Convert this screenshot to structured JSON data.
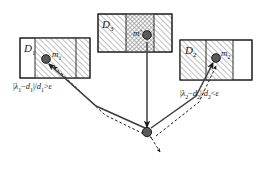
{
  "figure": {
    "title": "",
    "background_color": "#ffffff",
    "line_color": "#1a1a1a",
    "marker_color": "#555555",
    "hatch_color": "#888888"
  },
  "boxes": [
    {
      "id": "left",
      "label": "D",
      "label_sub": "1",
      "marker_label": "m",
      "marker_label_sub": "1",
      "marker_glyph": "filled-circle",
      "fill": "diagonal-hatch",
      "x": 20,
      "y": 38,
      "width": 70,
      "height": 40
    },
    {
      "id": "middle",
      "label": "D",
      "label_sub": "3",
      "marker_label": "m'",
      "marker_label_sub": "",
      "marker_glyph": "filled-circle",
      "fill": "cross-hatch",
      "x": 98,
      "y": 14,
      "width": 74,
      "height": 38
    },
    {
      "id": "right",
      "label": "D",
      "label_sub": "2",
      "marker_label": "m",
      "marker_label_sub": "2",
      "marker_glyph": "filled-circle",
      "fill": "diagonal-hatch",
      "x": 180,
      "y": 40,
      "width": 72,
      "height": 40
    }
  ],
  "formulas": [
    {
      "id": "left-condition",
      "numerator_abs_open": "|",
      "lambda": "λ",
      "lambda_sub": "1",
      "minus": "−",
      "d": "d",
      "d_sub": "1",
      "numerator_abs_close": "|",
      "slash": "/",
      "denominator": "d",
      "denominator_sub": "1",
      "operator": ">",
      "epsilon": "ε",
      "full_text": "|λ₁−d₁|/d₁ > ε"
    },
    {
      "id": "right-condition",
      "numerator_abs_open": "|",
      "lambda": "λ",
      "lambda_sub": "2",
      "minus": "−",
      "d": "d",
      "d_sub": "2",
      "numerator_abs_close": "|",
      "slash": "/",
      "denominator": "d",
      "denominator_sub": "2",
      "operator": "<",
      "epsilon": "ε",
      "full_text": "|λ₂−d₂|/d₂ < ε"
    }
  ],
  "nodes": [
    {
      "id": "convergence-node",
      "x": 147,
      "y": 132,
      "glyph": "filled-circle"
    }
  ],
  "arrows": [
    {
      "id": "left-solid-arrow",
      "style": "solid",
      "from": "convergence-node",
      "to": "left-marker"
    },
    {
      "id": "middle-solid-arrow",
      "style": "solid",
      "from": "middle-marker",
      "to": "convergence-node"
    },
    {
      "id": "right-solid-arrow",
      "style": "solid",
      "from": "convergence-node",
      "to": "right-marker"
    },
    {
      "id": "left-dashed-arrow",
      "style": "dashed",
      "from": "lower-right",
      "to": "left-marker"
    },
    {
      "id": "right-dashed-arrow",
      "style": "dashed",
      "from": "lower-right",
      "to": "right-marker"
    },
    {
      "id": "outgoing-dashed-arrow",
      "style": "dashed",
      "from": "convergence-node",
      "to": "lower-right"
    }
  ]
}
